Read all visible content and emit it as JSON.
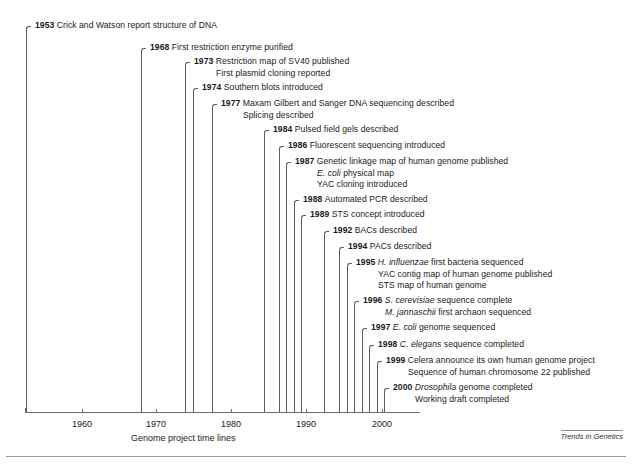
{
  "figure": {
    "axis_caption": "Genome project time lines",
    "journal_mark": "Trends in Genetics"
  },
  "axis": {
    "ticks": [
      {
        "year": 1960,
        "label": "1960"
      },
      {
        "year": 1970,
        "label": "1970"
      },
      {
        "year": 1980,
        "label": "1980"
      },
      {
        "year": 1990,
        "label": "1990"
      },
      {
        "year": 2000,
        "label": "2000"
      }
    ],
    "start_year": 1953,
    "end_year": 2001
  },
  "chart_data": {
    "type": "table",
    "title": "Genome project time lines",
    "xlabel": "Year",
    "xlim": [
      1953,
      2001
    ],
    "xticks": [
      1960,
      1970,
      1980,
      1990,
      2000
    ],
    "grid": false,
    "legend": "none",
    "events": [
      {
        "year": 1953,
        "lines": [
          "Crick and Watson report structure of DNA"
        ]
      },
      {
        "year": 1968,
        "lines": [
          "First restriction enzyme purified"
        ]
      },
      {
        "year": 1973,
        "lines": [
          "Restriction map of SV40 published",
          "First plasmid cloning reported"
        ]
      },
      {
        "year": 1974,
        "lines": [
          "Southern blots introduced"
        ]
      },
      {
        "year": 1977,
        "lines": [
          "Maxam Gilbert and Sanger DNA sequencing described",
          "Splicing described"
        ]
      },
      {
        "year": 1984,
        "lines": [
          "Pulsed field gels described"
        ]
      },
      {
        "year": 1986,
        "lines": [
          "Fluorescent sequencing introduced"
        ]
      },
      {
        "year": 1987,
        "lines": [
          "Genetic linkage map of human genome published",
          "E. coli physical map",
          "YAC cloning introduced"
        ]
      },
      {
        "year": 1988,
        "lines": [
          "Automated PCR described"
        ]
      },
      {
        "year": 1989,
        "lines": [
          "STS concept introduced"
        ]
      },
      {
        "year": 1992,
        "lines": [
          "BACs described"
        ]
      },
      {
        "year": 1994,
        "lines": [
          "PACs described"
        ]
      },
      {
        "year": 1995,
        "lines": [
          "H. influenzae first bacteria sequenced",
          "YAC contig map of human genome published",
          "STS map of human genome"
        ]
      },
      {
        "year": 1996,
        "lines": [
          "S. cerevisiae sequence complete",
          "M. jannaschii first archaon sequenced"
        ]
      },
      {
        "year": 1997,
        "lines": [
          "E. coli genome sequenced"
        ]
      },
      {
        "year": 1998,
        "lines": [
          "C. elegans sequence completed"
        ]
      },
      {
        "year": 1999,
        "lines": [
          "Celera announce its own human genome project",
          "Sequence of human chromosome 22 published"
        ]
      },
      {
        "year": 2000,
        "lines": [
          "Drosophila genome completed",
          "Working draft completed"
        ]
      }
    ]
  },
  "events": [
    {
      "name": "event-1953",
      "year": "1953",
      "x": 26,
      "y": 26,
      "bottom": 412,
      "lines": [
        {
          "segments": [
            {
              "text": "1953 ",
              "style": "year"
            },
            {
              "text": "Crick and Watson report structure of DNA",
              "style": "plain"
            }
          ]
        }
      ]
    },
    {
      "name": "event-1968",
      "year": "1968",
      "x": 141,
      "y": 48,
      "bottom": 412,
      "lines": [
        {
          "segments": [
            {
              "text": "1968 ",
              "style": "year"
            },
            {
              "text": "First restriction enzyme purified",
              "style": "plain"
            }
          ]
        }
      ]
    },
    {
      "name": "event-1973",
      "year": "1973",
      "x": 185,
      "y": 62,
      "bottom": 412,
      "lines": [
        {
          "segments": [
            {
              "text": "1973 ",
              "style": "year"
            },
            {
              "text": "Restriction map of SV40 published",
              "style": "plain"
            }
          ]
        },
        {
          "indent": true,
          "segments": [
            {
              "text": "First plasmid cloning reported",
              "style": "plain"
            }
          ]
        }
      ]
    },
    {
      "name": "event-1974",
      "year": "1974",
      "x": 193,
      "y": 88,
      "bottom": 412,
      "lines": [
        {
          "segments": [
            {
              "text": "1974 ",
              "style": "year"
            },
            {
              "text": "Southern blots introduced",
              "style": "plain"
            }
          ]
        }
      ]
    },
    {
      "name": "event-1977",
      "year": "1977",
      "x": 212,
      "y": 104,
      "bottom": 412,
      "lines": [
        {
          "segments": [
            {
              "text": "1977 ",
              "style": "year"
            },
            {
              "text": "Maxam Gilbert and Sanger DNA sequencing described",
              "style": "plain"
            }
          ]
        },
        {
          "indent": true,
          "segments": [
            {
              "text": "Splicing described",
              "style": "plain"
            }
          ]
        }
      ]
    },
    {
      "name": "event-1984",
      "year": "1984",
      "x": 264,
      "y": 130,
      "bottom": 412,
      "lines": [
        {
          "segments": [
            {
              "text": "1984 ",
              "style": "year"
            },
            {
              "text": "Pulsed field gels described",
              "style": "plain"
            }
          ]
        }
      ]
    },
    {
      "name": "event-1986",
      "year": "1986",
      "x": 279,
      "y": 146,
      "bottom": 412,
      "lines": [
        {
          "segments": [
            {
              "text": "1986 ",
              "style": "year"
            },
            {
              "text": "Fluorescent sequencing introduced",
              "style": "plain"
            }
          ]
        }
      ]
    },
    {
      "name": "event-1987",
      "year": "1987",
      "x": 286,
      "y": 162,
      "bottom": 412,
      "lines": [
        {
          "segments": [
            {
              "text": "1987 ",
              "style": "year"
            },
            {
              "text": "Genetic linkage map of human genome published",
              "style": "plain"
            }
          ]
        },
        {
          "indent": true,
          "segments": [
            {
              "text": "E. coli",
              "style": "italic"
            },
            {
              "text": " physical map",
              "style": "plain"
            }
          ]
        },
        {
          "indent": true,
          "segments": [
            {
              "text": "YAC cloning introduced",
              "style": "plain"
            }
          ]
        }
      ]
    },
    {
      "name": "event-1988",
      "year": "1988",
      "x": 294,
      "y": 200,
      "bottom": 412,
      "lines": [
        {
          "segments": [
            {
              "text": "1988 ",
              "style": "year"
            },
            {
              "text": "Automated PCR described",
              "style": "plain"
            }
          ]
        }
      ]
    },
    {
      "name": "event-1989",
      "year": "1989",
      "x": 301,
      "y": 215,
      "bottom": 412,
      "lines": [
        {
          "segments": [
            {
              "text": "1989 ",
              "style": "year"
            },
            {
              "text": "STS concept introduced",
              "style": "plain"
            }
          ]
        }
      ]
    },
    {
      "name": "event-1992",
      "year": "1992",
      "x": 324,
      "y": 231,
      "bottom": 412,
      "lines": [
        {
          "segments": [
            {
              "text": "1992 ",
              "style": "year"
            },
            {
              "text": "BACs described",
              "style": "plain"
            }
          ]
        }
      ]
    },
    {
      "name": "event-1994",
      "year": "1994",
      "x": 339,
      "y": 247,
      "bottom": 412,
      "lines": [
        {
          "segments": [
            {
              "text": "1994 ",
              "style": "year"
            },
            {
              "text": "PACs described",
              "style": "plain"
            }
          ]
        }
      ]
    },
    {
      "name": "event-1995",
      "year": "1995",
      "x": 347,
      "y": 263,
      "bottom": 412,
      "lines": [
        {
          "segments": [
            {
              "text": "1995 ",
              "style": "year"
            },
            {
              "text": "H. influenzae",
              "style": "italic"
            },
            {
              "text": " first bacteria sequenced",
              "style": "plain"
            }
          ]
        },
        {
          "indent": true,
          "segments": [
            {
              "text": "YAC contig map of human genome published",
              "style": "plain"
            }
          ]
        },
        {
          "indent": true,
          "segments": [
            {
              "text": "STS map of human genome",
              "style": "plain"
            }
          ]
        }
      ]
    },
    {
      "name": "event-1996",
      "year": "1996",
      "x": 354,
      "y": 301,
      "bottom": 412,
      "lines": [
        {
          "segments": [
            {
              "text": "1996 ",
              "style": "year"
            },
            {
              "text": "S. cerevisiae",
              "style": "italic"
            },
            {
              "text": " sequence complete",
              "style": "plain"
            }
          ]
        },
        {
          "indent": true,
          "segments": [
            {
              "text": "M. jannaschii",
              "style": "italic"
            },
            {
              "text": " first archaon sequenced",
              "style": "plain"
            }
          ]
        }
      ]
    },
    {
      "name": "event-1997",
      "year": "1997",
      "x": 362,
      "y": 328,
      "bottom": 412,
      "lines": [
        {
          "segments": [
            {
              "text": "1997 ",
              "style": "year"
            },
            {
              "text": "E. coli",
              "style": "italic"
            },
            {
              "text": " genome sequenced",
              "style": "plain"
            }
          ]
        }
      ]
    },
    {
      "name": "event-1998",
      "year": "1998",
      "x": 369,
      "y": 345,
      "bottom": 412,
      "lines": [
        {
          "segments": [
            {
              "text": "1998 ",
              "style": "year"
            },
            {
              "text": "C. elegans",
              "style": "italic"
            },
            {
              "text": " sequence completed",
              "style": "plain"
            }
          ]
        }
      ]
    },
    {
      "name": "event-1999",
      "year": "1999",
      "x": 377,
      "y": 361,
      "bottom": 412,
      "lines": [
        {
          "segments": [
            {
              "text": "1999 ",
              "style": "year"
            },
            {
              "text": "Celera announce its own human genome project",
              "style": "plain"
            }
          ]
        },
        {
          "indent": true,
          "segments": [
            {
              "text": "Sequence of human chromosome 22 published",
              "style": "plain"
            }
          ]
        }
      ]
    },
    {
      "name": "event-2000",
      "year": "2000",
      "x": 384,
      "y": 388,
      "bottom": 412,
      "lines": [
        {
          "segments": [
            {
              "text": "2000 ",
              "style": "year"
            },
            {
              "text": "Drosophila",
              "style": "italic"
            },
            {
              "text": " genome completed",
              "style": "plain"
            }
          ]
        },
        {
          "indent": true,
          "segments": [
            {
              "text": "Working draft completed",
              "style": "plain"
            }
          ]
        }
      ]
    }
  ],
  "axis_geometry": {
    "left": 25,
    "right": 420,
    "y": 412,
    "tick_x": [
      82,
      156,
      231,
      306,
      382
    ],
    "caption_x": 131,
    "caption_y": 433,
    "label_y": 419
  }
}
